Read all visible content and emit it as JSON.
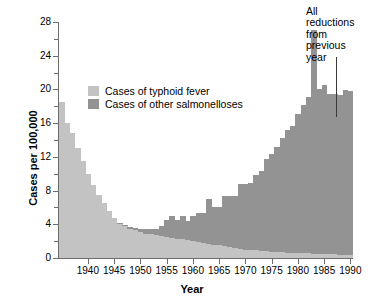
{
  "chart_data": {
    "type": "bar",
    "title": "",
    "subtitle": "",
    "xlabel": "Year",
    "ylabel": "Cases per 100,000",
    "xlim": [
      1935,
      1990
    ],
    "ylim": [
      0,
      28
    ],
    "ytick_step": 4,
    "yminor_step": 2,
    "grid": false,
    "stacked": true,
    "legend_position": "upper-left-inside",
    "yticks": [
      0,
      4,
      8,
      12,
      16,
      20,
      24,
      28
    ],
    "ytick_labels": [
      "0",
      "4",
      "8",
      "12",
      "16",
      "20",
      "24",
      "28"
    ],
    "xticks": [
      1940,
      1945,
      1950,
      1955,
      1960,
      1965,
      1970,
      1975,
      1980,
      1985,
      1990
    ],
    "xtick_labels": [
      "1940",
      "1945",
      "1950",
      "1955",
      "1960",
      "1965",
      "1970",
      "1975",
      "1980",
      "1985",
      "1990"
    ],
    "x": [
      1935,
      1936,
      1937,
      1938,
      1939,
      1940,
      1941,
      1942,
      1943,
      1944,
      1945,
      1946,
      1947,
      1948,
      1949,
      1950,
      1951,
      1952,
      1953,
      1954,
      1955,
      1956,
      1957,
      1958,
      1959,
      1960,
      1961,
      1962,
      1963,
      1964,
      1965,
      1966,
      1967,
      1968,
      1969,
      1970,
      1971,
      1972,
      1973,
      1974,
      1975,
      1976,
      1977,
      1978,
      1979,
      1980,
      1981,
      1982,
      1983,
      1984,
      1985,
      1986,
      1987,
      1988,
      1989,
      1990
    ],
    "series": [
      {
        "name": "Cases of typhoid fever",
        "color": "#c3c3c3",
        "values": [
          18.5,
          16.0,
          14.8,
          13.0,
          11.5,
          10.0,
          8.7,
          7.5,
          6.5,
          5.6,
          4.7,
          4.0,
          3.8,
          3.5,
          3.3,
          3.1,
          2.9,
          2.8,
          2.7,
          2.6,
          2.5,
          2.4,
          2.3,
          2.2,
          2.1,
          2.0,
          1.9,
          1.8,
          1.7,
          1.6,
          1.5,
          1.4,
          1.3,
          1.2,
          1.1,
          1.0,
          0.95,
          0.9,
          0.85,
          0.8,
          0.75,
          0.7,
          0.68,
          0.65,
          0.62,
          0.6,
          0.58,
          0.55,
          0.52,
          0.5,
          0.48,
          0.45,
          0.42,
          0.4,
          0.38,
          0.35
        ]
      },
      {
        "name": "Cases of other salmonelloses",
        "color": "#939393",
        "values": [
          0.0,
          0.0,
          0.0,
          0.0,
          0.0,
          0.0,
          0.0,
          0.0,
          0.0,
          0.0,
          0.1,
          0.1,
          0.1,
          0.2,
          0.3,
          0.4,
          0.5,
          0.6,
          0.8,
          1.2,
          2.0,
          2.6,
          2.2,
          2.8,
          2.3,
          3.0,
          3.4,
          3.5,
          5.3,
          4.4,
          4.6,
          6.0,
          6.0,
          6.1,
          7.7,
          7.8,
          8.0,
          9.0,
          9.5,
          11.0,
          11.6,
          12.5,
          13.5,
          14.5,
          15.0,
          16.5,
          17.6,
          18.5,
          26.5,
          19.5,
          20.0,
          19.0,
          19.0,
          19.0,
          19.6,
          19.5
        ]
      }
    ],
    "totals": [
      18.5,
      16.0,
      14.8,
      13.0,
      11.5,
      10.0,
      8.7,
      7.5,
      6.5,
      5.6,
      4.8,
      4.1,
      3.9,
      3.7,
      3.6,
      3.5,
      3.4,
      3.4,
      3.5,
      3.8,
      4.5,
      5.0,
      4.5,
      5.0,
      4.4,
      5.0,
      5.3,
      5.3,
      7.0,
      6.0,
      6.1,
      7.4,
      7.3,
      7.3,
      8.8,
      8.8,
      8.95,
      9.9,
      10.35,
      11.8,
      12.35,
      13.2,
      14.18,
      15.15,
      15.62,
      17.1,
      18.18,
      19.05,
      27.02,
      20.0,
      20.48,
      19.45,
      19.42,
      19.4,
      19.98,
      19.85
    ],
    "annotations": [
      {
        "name": "all-reductions-note",
        "lines": [
          "All",
          "reductions",
          "from",
          "previous",
          "year"
        ],
        "points_to_year": 1989
      }
    ]
  },
  "legend": {
    "items": [
      {
        "label": "Cases of typhoid fever",
        "color": "#c3c3c3"
      },
      {
        "label": "Cases of other salmonelloses",
        "color": "#939393"
      }
    ]
  },
  "axes": {
    "x_title": "Year",
    "y_title": "Cases per 100,000"
  },
  "annotation": {
    "line1": "All",
    "line2": "reductions",
    "line3": "from",
    "line4": "previous",
    "line5": "year"
  }
}
